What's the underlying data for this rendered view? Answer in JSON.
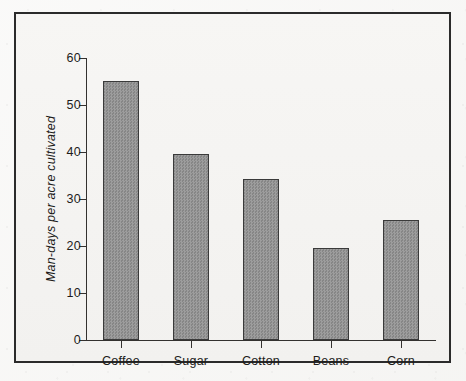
{
  "chart_data": {
    "type": "bar",
    "title": "",
    "subtitle": "",
    "xlabel": "",
    "ylabel": "Man-days per acre cultivated",
    "categories": [
      "Coffee",
      "Sugar",
      "Cotton",
      "Beans",
      "Corn"
    ],
    "values": [
      55.2,
      39.5,
      34.2,
      19.6,
      25.6
    ],
    "ylim": [
      0,
      60
    ],
    "yticks": [
      0,
      10,
      20,
      30,
      40,
      50,
      60
    ],
    "ytick_labels": [
      "0",
      "10",
      "20",
      "30",
      "40",
      "50",
      "60"
    ],
    "grid": false,
    "legend": null,
    "annotations": [],
    "series": [
      {
        "name": "Man-days per acre cultivated",
        "values": [
          55.2,
          39.5,
          34.2,
          19.6,
          25.6
        ]
      }
    ]
  },
  "style": {
    "bar_fill": "#8e8e8e",
    "bar_border": "#3a3a3a",
    "axis_color": "#33312f",
    "frame_color": "#2b2b2b",
    "background": "#f4f3f1",
    "text_color": "#1d1c1b"
  }
}
